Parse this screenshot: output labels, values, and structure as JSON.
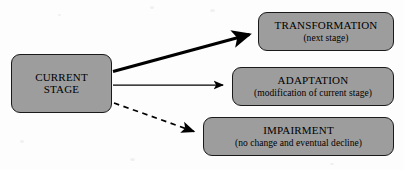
{
  "diagram": {
    "title_hidden": "",
    "nodes": {
      "source": {
        "name": "current-stage",
        "line1": "CURRENT",
        "line2": "STAGE"
      },
      "transformation": {
        "title": "TRANSFORMATION",
        "subtitle": "(next stage)"
      },
      "adaptation": {
        "title": "ADAPTATION",
        "subtitle": "(modification of current stage)"
      },
      "impairment": {
        "title": "IMPAIRMENT",
        "subtitle": "(no change and eventual decline)"
      }
    },
    "edges": [
      {
        "name": "edge-to-transformation",
        "style": "solid-thick",
        "from": "current-stage",
        "to": "transformation"
      },
      {
        "name": "edge-to-adaptation",
        "style": "solid-thin",
        "from": "current-stage",
        "to": "adaptation"
      },
      {
        "name": "edge-to-impairment",
        "style": "dashed",
        "from": "current-stage",
        "to": "impairment"
      }
    ],
    "colors": {
      "node_fill": "#9d9d9d",
      "node_border": "#1a1a1a",
      "edge": "#000000",
      "background": "#fdfdfd",
      "text": "#000000"
    }
  }
}
